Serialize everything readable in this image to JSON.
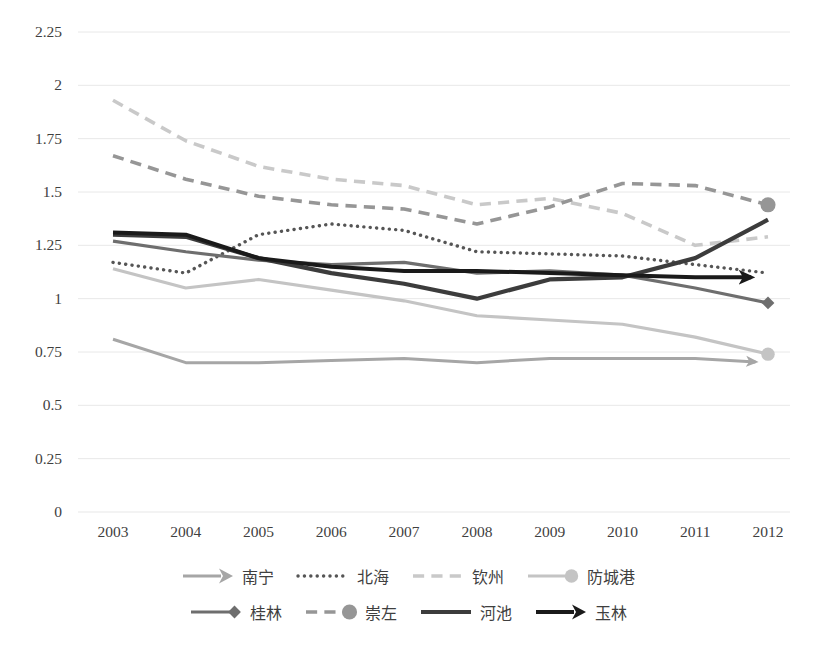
{
  "chart_data": {
    "type": "line",
    "title": "",
    "xlabel": "",
    "ylabel": "",
    "categories": [
      "2003",
      "2004",
      "2005",
      "2006",
      "2007",
      "2008",
      "2009",
      "2010",
      "2011",
      "2012"
    ],
    "ylim": [
      0,
      2.25
    ],
    "ytick_labels": [
      "0",
      "0.25",
      "0.5",
      "0.75",
      "1",
      "1.25",
      "1.5",
      "1.75",
      "2",
      "2.25"
    ],
    "ytick_values": [
      0,
      0.25,
      0.5,
      0.75,
      1,
      1.25,
      1.5,
      1.75,
      2,
      2.25
    ],
    "grid": true,
    "legend_position": "bottom",
    "series": [
      {
        "name": "南宁",
        "values": [
          0.81,
          0.7,
          0.7,
          0.71,
          0.72,
          0.7,
          0.72,
          0.72,
          0.72,
          0.7
        ],
        "color": "#a6a6a6",
        "style": "solid",
        "width": 3.0,
        "marker": "arrow"
      },
      {
        "name": "北海",
        "values": [
          1.17,
          1.12,
          1.3,
          1.35,
          1.32,
          1.22,
          1.21,
          1.2,
          1.16,
          1.12
        ],
        "color": "#555555",
        "style": "dotted",
        "width": 3.4,
        "marker": "none"
      },
      {
        "name": "钦州",
        "values": [
          1.93,
          1.74,
          1.62,
          1.56,
          1.53,
          1.44,
          1.47,
          1.4,
          1.25,
          1.29
        ],
        "color": "#c9c9c9",
        "style": "dashed",
        "width": 3.6,
        "marker": "none"
      },
      {
        "name": "防城港",
        "values": [
          1.14,
          1.05,
          1.09,
          1.04,
          0.99,
          0.92,
          0.9,
          0.88,
          0.82,
          0.74
        ],
        "color": "#c4c4c4",
        "style": "solid",
        "width": 3.2,
        "marker": "circle"
      },
      {
        "name": "桂林",
        "values": [
          1.27,
          1.22,
          1.18,
          1.16,
          1.17,
          1.12,
          1.13,
          1.11,
          1.05,
          0.98
        ],
        "color": "#6e6e6e",
        "style": "solid",
        "width": 3.2,
        "marker": "diamond"
      },
      {
        "name": "崇左",
        "values": [
          1.67,
          1.56,
          1.48,
          1.44,
          1.42,
          1.35,
          1.43,
          1.54,
          1.53,
          1.44
        ],
        "color": "#969696",
        "style": "dashed",
        "width": 3.6,
        "marker": "circle"
      },
      {
        "name": "河池",
        "values": [
          1.3,
          1.29,
          1.19,
          1.12,
          1.07,
          1.0,
          1.09,
          1.1,
          1.19,
          1.37
        ],
        "color": "#3c3c3c",
        "style": "solid",
        "width": 4.2,
        "marker": "none"
      },
      {
        "name": "玉林",
        "values": [
          1.31,
          1.3,
          1.19,
          1.15,
          1.13,
          1.13,
          1.12,
          1.11,
          1.1,
          1.1
        ],
        "color": "#1a1a1a",
        "style": "solid",
        "width": 4.0,
        "marker": "arrow"
      }
    ]
  },
  "legend": {
    "rows": [
      [
        {
          "label": "南宁",
          "series": 0
        },
        {
          "label": "北海",
          "series": 1
        },
        {
          "label": "钦州",
          "series": 2
        },
        {
          "label": "防城港",
          "series": 3
        }
      ],
      [
        {
          "label": "桂林",
          "series": 4
        },
        {
          "label": "崇左",
          "series": 5
        },
        {
          "label": "河池",
          "series": 6
        },
        {
          "label": "玉林",
          "series": 7
        }
      ]
    ]
  },
  "plot": {
    "left": 78,
    "right": 790,
    "top": 32,
    "bottom": 512,
    "first_x": 113,
    "last_x": 768,
    "gridline_color": "#e8e8e8"
  }
}
